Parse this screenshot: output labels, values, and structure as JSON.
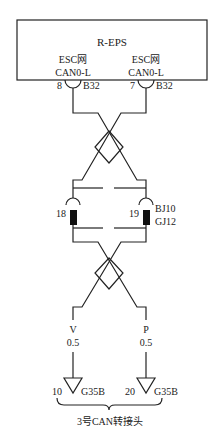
{
  "module": {
    "title": "R-EPS",
    "left_pin": {
      "net_label": "ESC网",
      "signal": "CAN0-L",
      "pin": "8",
      "connector": "B32"
    },
    "right_pin": {
      "net_label": "ESC网",
      "signal": "CAN0-L",
      "pin": "7",
      "connector": "B32"
    }
  },
  "middle_connector": {
    "left_pin": "18",
    "right_pin": "19",
    "connector_top": "BJ10",
    "connector_bottom": "GJ12"
  },
  "wires": {
    "left": {
      "color": "V",
      "gauge": "0.5"
    },
    "right": {
      "color": "P",
      "gauge": "0.5"
    }
  },
  "bottom_connector": {
    "left_pin": "10",
    "right_pin": "20",
    "left_connector": "G35B",
    "right_connector": "G35B",
    "label": "3号CAN转接头"
  }
}
